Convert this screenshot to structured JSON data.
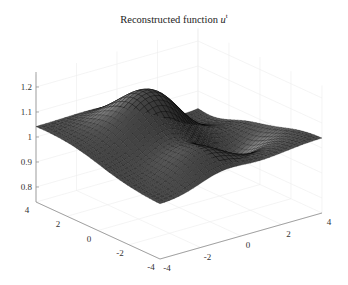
{
  "chart_data": {
    "type": "surface",
    "title_main": "Reconstructed function",
    "title_var": "u",
    "title_sup": "t",
    "xlabel": "",
    "ylabel": "",
    "zlabel": "",
    "x_ticks": [
      -4,
      -2,
      0,
      2,
      4
    ],
    "x_tick_labels": [
      "-4",
      "-2",
      "0",
      "2",
      "4"
    ],
    "y_ticks": [
      4,
      2,
      0,
      -2,
      -4
    ],
    "y_tick_labels": [
      "4",
      "2",
      "0",
      "-2",
      "-4"
    ],
    "z_ticks": [
      0.8,
      0.9,
      1,
      1.1,
      1.2
    ],
    "z_tick_labels": [
      "0.8",
      "0.9",
      "1",
      "1.1",
      "1.2"
    ],
    "xlim": [
      -4,
      4
    ],
    "ylim": [
      -4,
      4
    ],
    "zlim": [
      0.74,
      1.25
    ],
    "grid": true,
    "colormap": "gray",
    "mesh_resolution": 34,
    "surface_description": "Smooth undulating surface around 1.0; peak ~1.2 near back-centre, trough ~0.85 along the middle, values ~1.0 at corners"
  },
  "colors": {
    "surface_light": "#e6e6e6",
    "surface_dark": "#1c1c1c",
    "mesh_edge": "#000000",
    "axis": "#8c8c8c",
    "grid": "#ececec"
  }
}
